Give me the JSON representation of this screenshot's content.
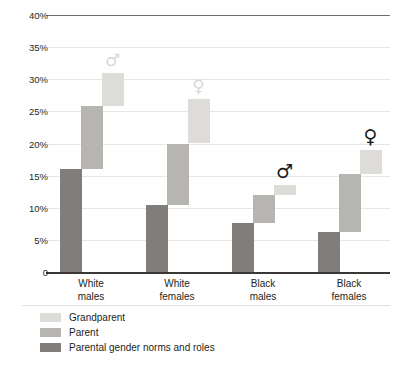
{
  "chart_data": {
    "type": "bar",
    "subtype": "stacked-waterfall-decomposition",
    "title": "",
    "xlabel": "",
    "ylabel": "",
    "ylim": [
      0,
      40
    ],
    "y_unit": "%",
    "grid": true,
    "legend_position": "bottom-left",
    "yticks": [
      {
        "value": 40,
        "label": "40%"
      },
      {
        "value": 35,
        "label": "35%"
      },
      {
        "value": 30,
        "label": "30%"
      },
      {
        "value": 25,
        "label": "25%"
      },
      {
        "value": 20,
        "label": "20%"
      },
      {
        "value": 15,
        "label": "15%"
      },
      {
        "value": 10,
        "label": "10%"
      },
      {
        "value": 5,
        "label": "5%"
      },
      {
        "value": 0,
        "label": "0"
      }
    ],
    "categories": [
      "White\nmales",
      "White\nfemales",
      "Black\nmales",
      "Black\nfemales"
    ],
    "category_lines": [
      [
        "White",
        "males"
      ],
      [
        "White",
        "females"
      ],
      [
        "Black",
        "males"
      ],
      [
        "Black",
        "females"
      ]
    ],
    "series": [
      {
        "name": "Parental gender norms and roles",
        "color": "#807d7a",
        "values": [
          16.0,
          10.5,
          7.6,
          6.3
        ],
        "segments": [
          {
            "start": 0,
            "end": 16.0
          },
          {
            "start": 0,
            "end": 10.5
          },
          {
            "start": 0,
            "end": 7.6
          },
          {
            "start": 0,
            "end": 6.3
          }
        ]
      },
      {
        "name": "Parent",
        "color": "#b7b5b2",
        "values": [
          9.8,
          9.5,
          4.4,
          9.0
        ],
        "segments": [
          {
            "start": 16.0,
            "end": 25.8
          },
          {
            "start": 10.5,
            "end": 20.0
          },
          {
            "start": 7.6,
            "end": 12.0
          },
          {
            "start": 6.3,
            "end": 15.3
          }
        ]
      },
      {
        "name": "Grandparent",
        "color": "#dedcd9",
        "values": [
          5.2,
          7.0,
          1.5,
          3.7
        ],
        "segments": [
          {
            "start": 25.8,
            "end": 31.0
          },
          {
            "start": 20.0,
            "end": 27.0
          },
          {
            "start": 12.0,
            "end": 13.5
          },
          {
            "start": 15.3,
            "end": 19.0
          }
        ]
      }
    ],
    "totals": [
      31.0,
      27.0,
      13.5,
      19.0
    ],
    "annotations": [
      {
        "category": "White males",
        "glyph": "♂",
        "style": "light",
        "at_value": 31.0
      },
      {
        "category": "White females",
        "glyph": "♀",
        "style": "light",
        "at_value": 27.0
      },
      {
        "category": "Black males",
        "glyph": "♂",
        "style": "dark",
        "at_value": 13.5
      },
      {
        "category": "Black females",
        "glyph": "♀",
        "style": "dark",
        "at_value": 19.0
      }
    ]
  },
  "legend": {
    "items": [
      {
        "label": "Grandparent",
        "key": "grandparent"
      },
      {
        "label": "Parent",
        "key": "parent"
      },
      {
        "label": "Parental gender norms and roles",
        "key": "norms"
      }
    ]
  },
  "colors": {
    "grandparent": "#dedcd9",
    "parent": "#b7b5b2",
    "norms": "#807d7a",
    "axis": "#3a3735",
    "grid": "#e8e6e4",
    "text": "#231f20"
  }
}
